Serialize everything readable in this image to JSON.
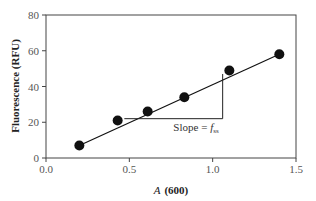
{
  "chart_data": {
    "type": "scatter",
    "title": "",
    "xlabel": "A (600)",
    "xlabel_italic_part": "A",
    "xlabel_bold_part": "(600)",
    "ylabel": "Fluorescence (RFU)",
    "xlim": [
      0.0,
      1.5
    ],
    "ylim": [
      0,
      80
    ],
    "x_ticks": [
      0.0,
      0.5,
      1.0,
      1.5
    ],
    "x_tick_labels": [
      "0.0",
      "0.5",
      "1.0",
      "1.5"
    ],
    "y_ticks": [
      0,
      20,
      40,
      60,
      80
    ],
    "y_tick_labels": [
      "0",
      "20",
      "40",
      "60",
      "80"
    ],
    "grid": false,
    "legend": null,
    "series": [
      {
        "name": "Measured fluorescence",
        "marker": "filled-circle",
        "color": "#111111",
        "x": [
          0.2,
          0.43,
          0.61,
          0.83,
          1.1,
          1.4
        ],
        "y": [
          7,
          21,
          26,
          34,
          49,
          58
        ]
      },
      {
        "name": "Linear fit",
        "style": "line",
        "color": "#111111",
        "x": [
          0.2,
          1.4
        ],
        "y": [
          7,
          58
        ]
      }
    ],
    "annotations": [
      {
        "type": "slope-triangle",
        "horizontal": {
          "x0": 0.47,
          "x1": 1.06,
          "y": 22
        },
        "vertical": {
          "x": 1.06,
          "y0": 22,
          "y1": 47
        },
        "label": "Slope = f",
        "label_prefix": "Slope = ",
        "label_var": "f",
        "label_sub": "ss",
        "label_pos": {
          "x": 0.9,
          "y": 15
        }
      }
    ]
  }
}
